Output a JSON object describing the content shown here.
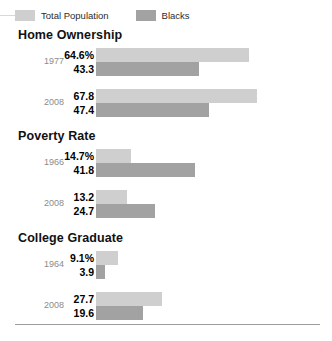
{
  "chart_data": {
    "type": "bar",
    "title": "",
    "orientation": "horizontal",
    "xlabel": "",
    "ylabel": "",
    "grid": false,
    "legend_position": "top-left",
    "value_unit": "percent",
    "axis_start": 0,
    "max_value": 67.8,
    "legend": [
      {
        "name": "Total Population",
        "color": "#cfcfcf"
      },
      {
        "name": "Blacks",
        "color": "#a2a2a2"
      }
    ],
    "sections": [
      {
        "title": "Home Ownership",
        "groups": [
          {
            "year": "1977",
            "total_label": "64.6%",
            "total_value": 64.6,
            "blacks_label": "43.3",
            "blacks_value": 43.3
          },
          {
            "year": "2008",
            "total_label": "67.8",
            "total_value": 67.8,
            "blacks_label": "47.4",
            "blacks_value": 47.4
          }
        ]
      },
      {
        "title": "Poverty Rate",
        "groups": [
          {
            "year": "1966",
            "total_label": "14.7%",
            "total_value": 14.7,
            "blacks_label": "41.8",
            "blacks_value": 41.8
          },
          {
            "year": "2008",
            "total_label": "13.2",
            "total_value": 13.2,
            "blacks_label": "24.7",
            "blacks_value": 24.7
          }
        ]
      },
      {
        "title": "College Graduate",
        "groups": [
          {
            "year": "1964",
            "total_label": "9.1%",
            "total_value": 9.1,
            "blacks_label": "3.9",
            "blacks_value": 3.9
          },
          {
            "year": "2008",
            "total_label": "27.7",
            "total_value": 27.7,
            "blacks_label": "19.6",
            "blacks_value": 19.6
          }
        ]
      }
    ]
  }
}
